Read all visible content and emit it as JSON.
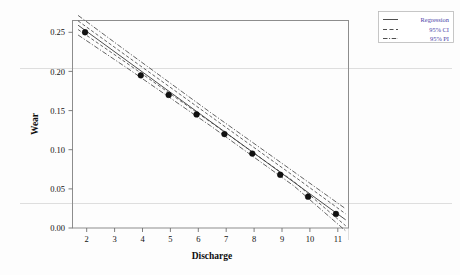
{
  "chart_data": {
    "type": "scatter",
    "title": "",
    "xlabel": "Discharge",
    "ylabel": "Wear",
    "xlim": [
      1.55,
      11.45
    ],
    "ylim": [
      0.0,
      0.265
    ],
    "xticks": [
      2,
      3,
      4,
      5,
      6,
      7,
      8,
      9,
      10,
      11
    ],
    "xtick_labels": [
      "2",
      "3",
      "4",
      "5",
      "6",
      "7",
      "8",
      "9",
      "10",
      "11"
    ],
    "yticks": [
      0.0,
      0.05,
      0.1,
      0.15,
      0.2,
      0.25
    ],
    "ytick_labels": [
      "0.00",
      "0.05",
      "0.10",
      "0.15",
      "0.20",
      "0.25"
    ],
    "grid": false,
    "x": [
      2,
      4,
      5,
      6,
      7,
      8,
      9,
      10,
      11
    ],
    "y": [
      0.25,
      0.195,
      0.17,
      0.145,
      0.12,
      0.095,
      0.068,
      0.04,
      0.018
    ],
    "series": [
      {
        "name": "Observations",
        "kind": "scatter",
        "x": [
          2,
          4,
          5,
          6,
          7,
          8,
          9,
          10,
          11
        ],
        "values": [
          0.25,
          0.195,
          0.17,
          0.145,
          0.12,
          0.095,
          0.068,
          0.04,
          0.018
        ]
      },
      {
        "name": "Regression",
        "kind": "line",
        "style": "solid",
        "intercept": 0.3043,
        "slope": -0.0259,
        "x": [
          1.75,
          11.35
        ],
        "values": [
          0.259,
          0.0104
        ]
      },
      {
        "name": "95% CI",
        "kind": "band",
        "style": "dashed",
        "x": [
          1.75,
          3.5,
          6.5,
          9.5,
          11.35
        ],
        "upper": [
          0.2645,
          0.2195,
          0.1427,
          0.066,
          0.018
        ],
        "lower": [
          0.2535,
          0.2105,
          0.1353,
          0.059,
          0.0028
        ]
      },
      {
        "name": "95% PI",
        "kind": "band",
        "style": "dashdot",
        "x": [
          1.75,
          3.5,
          6.5,
          9.5,
          11.35
        ],
        "upper": [
          0.2715,
          0.2255,
          0.1475,
          0.0715,
          0.0245
        ],
        "lower": [
          0.2465,
          0.2045,
          0.1305,
          0.0535,
          -0.0037
        ]
      }
    ],
    "annotations": [
      {
        "name": "stray-gridline-upper",
        "y": 0.205,
        "full_width": true
      },
      {
        "name": "stray-gridline-lower",
        "y": 0.035,
        "full_width": true
      },
      {
        "name": "top-gradient-line",
        "colors": [
          "#b06ec0",
          "#8fc98f"
        ]
      }
    ],
    "legend": {
      "position": "top-right",
      "entries": [
        {
          "label": "Regression",
          "style": "solid"
        },
        {
          "label": "95% CI",
          "style": "dashed"
        },
        {
          "label": "95% PI",
          "style": "dashdot"
        }
      ]
    },
    "colors": {
      "point": "#111111",
      "line": "#3b3b3b",
      "frame": "#8d8d8d",
      "grid": "#dadada",
      "legend_text": "#4a3fa8",
      "background": "#fdfdfd",
      "gradient_start": "#b06ec0",
      "gradient_end": "#8fc98f"
    }
  }
}
